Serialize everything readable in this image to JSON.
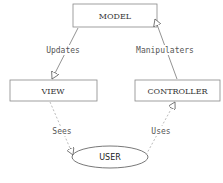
{
  "diagram": {
    "nodes": [
      {
        "id": "model",
        "label": "MODEL",
        "shape": "rectangle"
      },
      {
        "id": "view",
        "label": "VIEW",
        "shape": "rectangle"
      },
      {
        "id": "controller",
        "label": "CONTROLLER",
        "shape": "rectangle"
      },
      {
        "id": "user",
        "label": "USER",
        "shape": "ellipse"
      }
    ],
    "edges": [
      {
        "from": "model",
        "to": "view",
        "label": "Updates",
        "style": "solid"
      },
      {
        "from": "controller",
        "to": "model",
        "label": "Manipulaters",
        "style": "solid"
      },
      {
        "from": "view",
        "to": "user",
        "label": "Sees",
        "style": "dashed"
      },
      {
        "from": "user",
        "to": "controller",
        "label": "Uses",
        "style": "dashed"
      }
    ]
  },
  "colors": {
    "line": "#666666",
    "dashed_line": "#999999",
    "text": "#333333",
    "background": "#ffffff"
  }
}
